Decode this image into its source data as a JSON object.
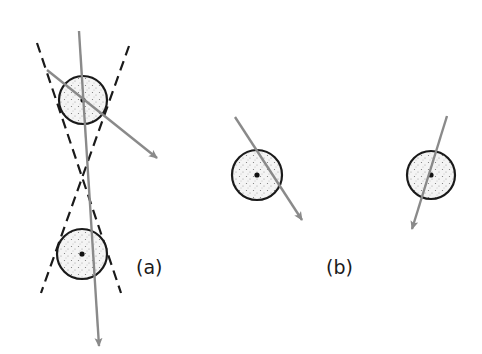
{
  "figure": {
    "panels": [
      {
        "id": "a",
        "label": "(a)",
        "circles": [
          {
            "cx": 83,
            "cy": 100,
            "r": 24
          },
          {
            "cx": 82,
            "cy": 254,
            "r": 25
          }
        ],
        "tangent_lines": [
          {
            "x1": 37,
            "y1": 43,
            "x2": 121,
            "y2": 293
          },
          {
            "x1": 129,
            "y1": 46,
            "x2": 41,
            "y2": 293
          }
        ],
        "arrows": [
          {
            "x1": 79,
            "y1": 31,
            "x2": 99,
            "y2": 346
          },
          {
            "x1": 47,
            "y1": 70,
            "x2": 157,
            "y2": 158
          }
        ]
      },
      {
        "id": "b",
        "label": "(b)",
        "circles": [
          {
            "cx": 257,
            "cy": 175,
            "r": 25
          },
          {
            "cx": 431,
            "cy": 175,
            "r": 24
          }
        ],
        "arrows": [
          {
            "x1": 235,
            "y1": 117,
            "x2": 302,
            "y2": 220
          },
          {
            "x1": 447,
            "y1": 116,
            "x2": 412,
            "y2": 229
          }
        ]
      }
    ],
    "colors": {
      "outline": "#1a1a1a",
      "arrow": "#8a8a8a",
      "fill": "#f2f2f2",
      "stipple": "#7a7a7a"
    }
  }
}
